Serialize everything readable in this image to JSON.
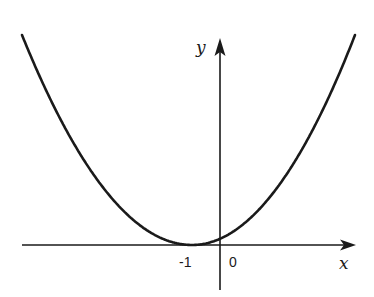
{
  "chart_data": {
    "type": "line",
    "title": "",
    "xlabel": "x",
    "ylabel": "y",
    "function": "y = (x + 1)^2",
    "series": [
      {
        "name": "parabola",
        "x": [
          -7,
          -6,
          -5,
          -4,
          -3,
          -2,
          -1,
          0,
          1,
          2,
          3,
          4,
          5
        ],
        "values": [
          36,
          25,
          16,
          9,
          4,
          1,
          0,
          1,
          4,
          9,
          16,
          25,
          36
        ]
      }
    ],
    "x_tick_labels": [
      "-1",
      "0"
    ],
    "x_ticks": [
      -1,
      0
    ],
    "vertex": {
      "x": -1,
      "y": 0
    },
    "grid": false,
    "legend": false,
    "colors": {
      "curve": "#1a1a1a",
      "axes": "#1a1a1a",
      "background": "#ffffff"
    }
  },
  "labels": {
    "x_axis": "x",
    "y_axis": "y",
    "tick_minus_one": "-1",
    "tick_zero": "0"
  }
}
